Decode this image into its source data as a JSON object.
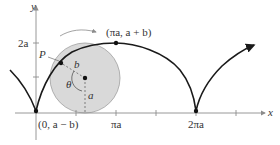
{
  "diagram": {
    "type": "curtate/prolate cycloid with rolling circle",
    "axes": {
      "x_label": "x",
      "y_label": "y",
      "x_ticks": [
        "πa",
        "2πa"
      ],
      "y_ticks": [
        "2a"
      ]
    },
    "labels": {
      "point_p": "P",
      "radius_b": "b",
      "radius_a": "a",
      "angle": "θ",
      "peak": "(πa, a + b)",
      "start": "(0, a − b)"
    },
    "colors": {
      "curve": "#1a1a1a",
      "circle_fill": "#d9d9d9",
      "circle_stroke": "#9a9a9a",
      "axis": "#8c8c8c",
      "text": "#333333"
    }
  }
}
